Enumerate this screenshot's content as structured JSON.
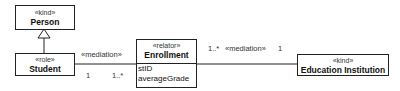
{
  "classes": {
    "person": {
      "stereotype": "«kind»",
      "name": "Person"
    },
    "student": {
      "stereotype": "«role»",
      "name": "Student"
    },
    "enrollment": {
      "stereotype": "«relator»",
      "name": "Enrollment",
      "attributes": [
        "stID",
        "averageGrade"
      ]
    },
    "education": {
      "stereotype": "«kind»",
      "name": "Education Institution"
    }
  },
  "associations": {
    "student_enrollment": {
      "label": "«mediation»",
      "mult_student": "1",
      "mult_enrollment": "1..*"
    },
    "enrollment_education": {
      "label": "«mediation»",
      "mult_enrollment": "1..*",
      "mult_education": "1"
    }
  }
}
